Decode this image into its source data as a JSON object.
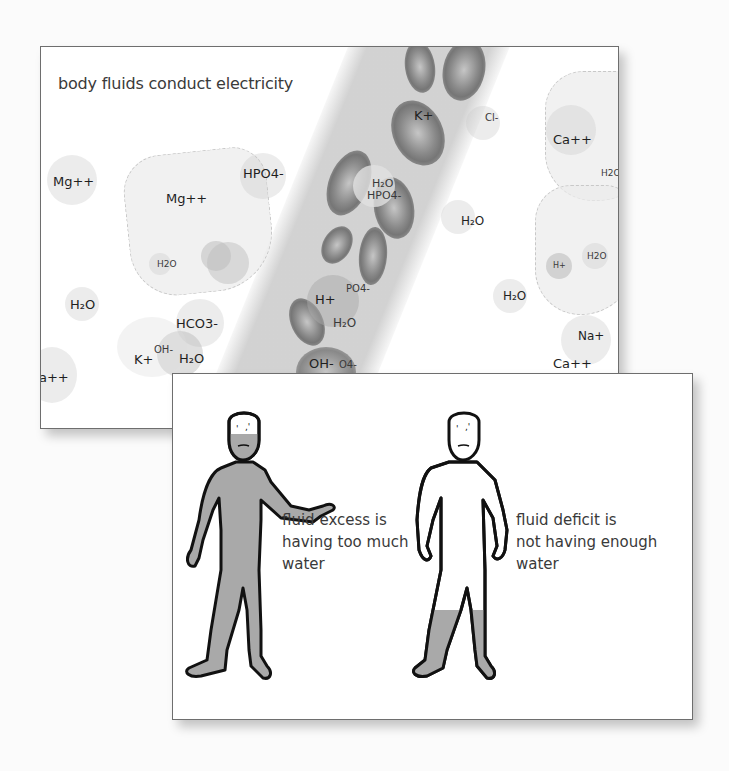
{
  "top_panel": {
    "caption": "body fluids conduct electricity",
    "molecules": {
      "mg_outer": "Mg++",
      "mg_cell": "Mg++",
      "hpo4_top": "HPO4-",
      "h2o_cell_small": "H2O",
      "h2o_left": "H₂O",
      "hco3": "HCO3-",
      "k_bottom": "K+",
      "oh_bottom": "OH-",
      "h2o_bottom": "H₂O",
      "ca_edge": "a++",
      "k_vessel": "K+",
      "cl_partial": "Cl-",
      "h2o_vessel": "H₂O",
      "hpo4_vessel": "HPO4-",
      "h2o_mid": "H₂O",
      "h_vessel": "H+",
      "hpo4_vessel_partial": "PO4-",
      "h2o_vessel_low": "H₂O",
      "oh_vessel": "OH-",
      "po4_vessel_low": "O4-",
      "ca_right": "Ca++",
      "h2o_right_edge": "H2O",
      "h_right_cell": "H+",
      "h2o_right_cell": "H2O",
      "h2o_right": "H₂O",
      "na_right": "Na+",
      "ca_right_low": "Ca++"
    }
  },
  "bottom_panel": {
    "excess": {
      "lines": [
        "fluid excess is",
        "having too much",
        "water"
      ]
    },
    "deficit": {
      "lines": [
        "fluid deficit is",
        "not having enough",
        "water"
      ]
    }
  },
  "colors": {
    "fluid_fill": "#a9a9a9",
    "outline": "#111111",
    "card_border": "#6e6e6e"
  }
}
